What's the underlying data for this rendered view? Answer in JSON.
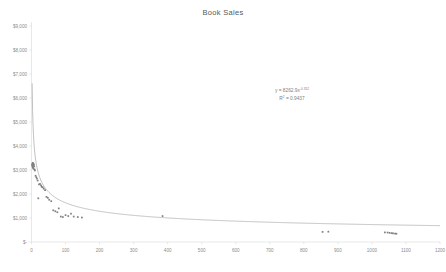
{
  "chart_data": {
    "type": "scatter",
    "title": "Book Sales",
    "xlabel": "",
    "ylabel": "",
    "xlim": [
      0,
      1200
    ],
    "ylim": [
      0,
      9000
    ],
    "grid": false,
    "legend": false,
    "x_ticks": [
      "0",
      "100",
      "200",
      "300",
      "400",
      "500",
      "600",
      "700",
      "800",
      "900",
      "1000",
      "1100",
      "1200"
    ],
    "x_tick_values": [
      0,
      100,
      200,
      300,
      400,
      500,
      600,
      700,
      800,
      900,
      1000,
      1100,
      1200
    ],
    "y_ticks": [
      "$-",
      "$1,000",
      "$2,000",
      "$3,000",
      "$4,000",
      "$5,000",
      "$6,000",
      "$7,000",
      "$8,000",
      "$9,000"
    ],
    "y_tick_values": [
      0,
      1000,
      2000,
      3000,
      4000,
      5000,
      6000,
      7000,
      8000,
      9000
    ],
    "annotations": [
      {
        "text": "y = 8262.9x",
        "exponent": "-0.352",
        "kind": "trendline-equation"
      },
      {
        "text": "R",
        "exponent": "2",
        "suffix": " = 0.9437",
        "kind": "r-squared"
      }
    ],
    "series": [
      {
        "name": "Book Sales",
        "type": "scatter",
        "marker_color": "#7f7f7f",
        "points": [
          [
            2,
            3250
          ],
          [
            2,
            3200
          ],
          [
            3,
            3180
          ],
          [
            3,
            3140
          ],
          [
            4,
            3300
          ],
          [
            4,
            3120
          ],
          [
            5,
            3240
          ],
          [
            5,
            3080
          ],
          [
            6,
            3260
          ],
          [
            6,
            3050
          ],
          [
            7,
            3210
          ],
          [
            8,
            3150
          ],
          [
            9,
            3020
          ],
          [
            10,
            2980
          ],
          [
            12,
            2760
          ],
          [
            14,
            2700
          ],
          [
            16,
            2640
          ],
          [
            18,
            2560
          ],
          [
            20,
            1820
          ],
          [
            22,
            2400
          ],
          [
            25,
            2420
          ],
          [
            28,
            2360
          ],
          [
            30,
            2300
          ],
          [
            33,
            2280
          ],
          [
            36,
            2220
          ],
          [
            40,
            2160
          ],
          [
            44,
            1880
          ],
          [
            48,
            1840
          ],
          [
            52,
            1760
          ],
          [
            58,
            1700
          ],
          [
            64,
            1320
          ],
          [
            70,
            1280
          ],
          [
            76,
            1240
          ],
          [
            80,
            1400
          ],
          [
            86,
            1060
          ],
          [
            92,
            1040
          ],
          [
            100,
            1120
          ],
          [
            108,
            1080
          ],
          [
            116,
            1180
          ],
          [
            124,
            1060
          ],
          [
            136,
            1040
          ],
          [
            148,
            1020
          ],
          [
            385,
            1080
          ],
          [
            855,
            420
          ],
          [
            872,
            430
          ],
          [
            1038,
            400
          ],
          [
            1046,
            395
          ],
          [
            1052,
            380
          ],
          [
            1058,
            370
          ],
          [
            1062,
            360
          ],
          [
            1068,
            350
          ],
          [
            1072,
            345
          ]
        ]
      },
      {
        "name": "Power trendline",
        "type": "line",
        "line_color": "#a6a6a6",
        "formula": "y = 8262.9 * x^-0.352",
        "coefficient": 8262.9,
        "exponent": -0.352,
        "r_squared": 0.9437
      }
    ]
  }
}
